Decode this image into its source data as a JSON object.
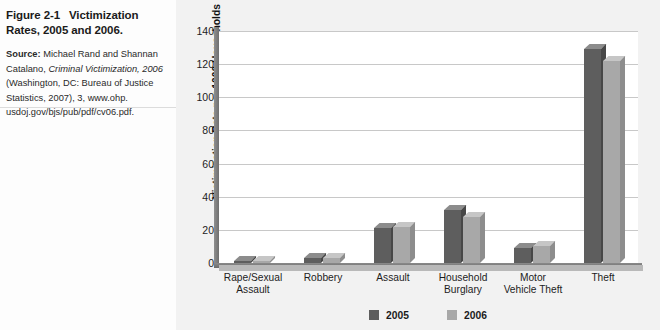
{
  "caption": {
    "figure_number": "Figure 2-1",
    "figure_title": "Victimization Rates, 2005 and 2006.",
    "source_label": "Source:",
    "source_line1": "Michael Rand and Shannan",
    "source_line2_pre": "Catalano, ",
    "source_line2_italic": "Criminal Victimization, 2006",
    "source_line3": "(Washington, DC: Bureau of Justice",
    "source_line4": "Statistics, 2007), 3, www.ohp.",
    "source_line5": "usdoj.gov/bjs/pub/pdf/cv06.pdf."
  },
  "chart_data": {
    "type": "bar",
    "title": "",
    "xlabel": "",
    "ylabel": "Victimization Rate per 1000 Households",
    "ylim": [
      0,
      140
    ],
    "yticks": [
      0,
      20,
      40,
      60,
      80,
      100,
      120,
      140
    ],
    "grid": true,
    "legend_position": "bottom",
    "categories": [
      "Rape/Sexual Assault",
      "Robbery",
      "Assault",
      "Household Burglary",
      "Motor Vehicle Theft",
      "Theft"
    ],
    "category_lines": [
      [
        "Rape/Sexual",
        "Assault"
      ],
      [
        "Robbery",
        ""
      ],
      [
        "Assault",
        ""
      ],
      [
        "Household",
        "Burglary"
      ],
      [
        "Motor",
        "Vehicle Theft"
      ],
      [
        "Theft",
        ""
      ]
    ],
    "series": [
      {
        "name": "2005",
        "color": "#5e5e5e",
        "values": [
          1,
          3,
          21,
          32,
          9,
          129
        ]
      },
      {
        "name": "2006",
        "color": "#a8a8a8",
        "values": [
          1,
          3,
          22,
          28,
          10,
          122
        ]
      }
    ]
  }
}
